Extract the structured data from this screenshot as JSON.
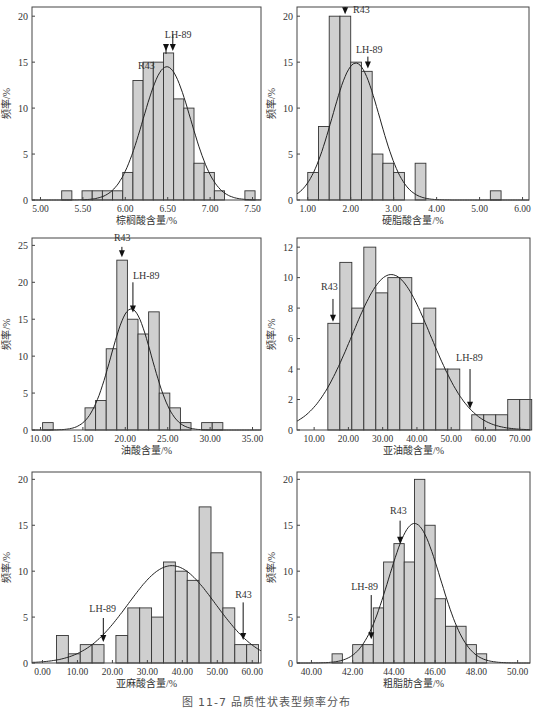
{
  "figure": {
    "caption": "图 11-7  品质性状表型频率分布"
  },
  "chart_data": [
    {
      "id": "palmitic",
      "type": "bar",
      "title": "",
      "xlabel": "棕榈酸含量/%",
      "ylabel": "频率/%",
      "xlim": [
        4.9,
        7.6
      ],
      "ylim": [
        0,
        21
      ],
      "xticks": [
        5.0,
        5.5,
        6.0,
        6.5,
        7.0,
        7.5
      ],
      "xtick_labels": [
        "5.00",
        "5.50",
        "6.00",
        "6.50",
        "7.00",
        "7.50"
      ],
      "yticks": [
        0,
        5,
        10,
        15,
        20
      ],
      "bin_width": 0.12,
      "bins": [
        {
          "x": 5.25,
          "y": 1
        },
        {
          "x": 5.49,
          "y": 1
        },
        {
          "x": 5.61,
          "y": 1
        },
        {
          "x": 5.73,
          "y": 1
        },
        {
          "x": 5.85,
          "y": 1
        },
        {
          "x": 5.97,
          "y": 3
        },
        {
          "x": 6.09,
          "y": 13
        },
        {
          "x": 6.21,
          "y": 15
        },
        {
          "x": 6.33,
          "y": 15
        },
        {
          "x": 6.45,
          "y": 16
        },
        {
          "x": 6.57,
          "y": 11
        },
        {
          "x": 6.69,
          "y": 10
        },
        {
          "x": 6.81,
          "y": 4
        },
        {
          "x": 6.93,
          "y": 3
        },
        {
          "x": 7.05,
          "y": 1
        },
        {
          "x": 7.41,
          "y": 1
        }
      ],
      "normal_curve": {
        "mean": 6.49,
        "sd": 0.28,
        "peak": 14.5
      },
      "annotations": [
        {
          "label": "R43",
          "x": 6.48,
          "label_dx": -28,
          "label_y": 14.3,
          "arrow_from": 15.9,
          "arrow_to": 16.2
        },
        {
          "label": "LH-89",
          "x": 6.56,
          "label_dx": -8,
          "label_y": 17.6,
          "arrow_from": 18.0,
          "arrow_to": 16.2
        }
      ],
      "grid": false
    },
    {
      "id": "stearic",
      "type": "bar",
      "title": "",
      "xlabel": "硬脂酸含量/%",
      "ylabel": "频率/%",
      "xlim": [
        0.75,
        6.15
      ],
      "ylim": [
        0,
        21
      ],
      "xticks": [
        1,
        2,
        3,
        4,
        5,
        6
      ],
      "xtick_labels": [
        "1.00",
        "2.00",
        "3.00",
        "4.00",
        "5.00",
        "6.00"
      ],
      "yticks": [
        0,
        5,
        10,
        15,
        20
      ],
      "bin_width": 0.25,
      "bins": [
        {
          "x": 1.0,
          "y": 3
        },
        {
          "x": 1.25,
          "y": 8
        },
        {
          "x": 1.5,
          "y": 20
        },
        {
          "x": 1.75,
          "y": 20
        },
        {
          "x": 2.0,
          "y": 15
        },
        {
          "x": 2.25,
          "y": 14
        },
        {
          "x": 2.5,
          "y": 5
        },
        {
          "x": 2.75,
          "y": 4
        },
        {
          "x": 3.0,
          "y": 3
        },
        {
          "x": 3.5,
          "y": 4
        },
        {
          "x": 5.25,
          "y": 1
        }
      ],
      "normal_curve": {
        "mean": 2.12,
        "sd": 0.55,
        "peak": 14.9
      },
      "annotations": [
        {
          "label": "R43",
          "x": 1.87,
          "label_dx": 8,
          "label_y": 20.4,
          "arrow_from": 21.0,
          "arrow_to": 20.2
        },
        {
          "label": "LH-89",
          "x": 2.4,
          "label_dx": -12,
          "label_y": 16.0,
          "arrow_from": 15.6,
          "arrow_to": 14.3
        }
      ],
      "grid": false
    },
    {
      "id": "oleic",
      "type": "bar",
      "title": "",
      "xlabel": "油酸含量/%",
      "ylabel": "频率/%",
      "xlim": [
        9.0,
        36.0
      ],
      "ylim": [
        0,
        26
      ],
      "xticks": [
        10,
        15,
        20,
        25,
        30,
        35
      ],
      "xtick_labels": [
        "10.00",
        "15.00",
        "20.00",
        "25.00",
        "30.00",
        "35.00"
      ],
      "yticks": [
        0,
        5,
        10,
        15,
        20,
        25
      ],
      "bin_width": 1.25,
      "bins": [
        {
          "x": 10.25,
          "y": 1
        },
        {
          "x": 15.25,
          "y": 3
        },
        {
          "x": 16.5,
          "y": 4
        },
        {
          "x": 17.75,
          "y": 11
        },
        {
          "x": 19.0,
          "y": 23
        },
        {
          "x": 20.25,
          "y": 15
        },
        {
          "x": 21.5,
          "y": 13
        },
        {
          "x": 22.75,
          "y": 16
        },
        {
          "x": 24.0,
          "y": 5
        },
        {
          "x": 25.25,
          "y": 3
        },
        {
          "x": 26.5,
          "y": 1
        },
        {
          "x": 29.0,
          "y": 1
        },
        {
          "x": 30.25,
          "y": 1
        }
      ],
      "normal_curve": {
        "mean": 20.7,
        "sd": 2.4,
        "peak": 16.4
      },
      "annotations": [
        {
          "label": "R43",
          "x": 19.6,
          "label_dx": -8,
          "label_y": 25.6,
          "arrow_from": 24.8,
          "arrow_to": 23.4
        },
        {
          "label": "LH-89",
          "x": 20.9,
          "label_dx": 0,
          "label_y": 20.4,
          "arrow_from": 20.0,
          "arrow_to": 15.9
        }
      ],
      "grid": false
    },
    {
      "id": "linoleic",
      "type": "bar",
      "title": "",
      "xlabel": "亚油酸含量/%",
      "ylabel": "频率/%",
      "xlim": [
        5.0,
        73.0
      ],
      "ylim": [
        0,
        12.6
      ],
      "xticks": [
        10,
        20,
        30,
        40,
        50,
        60,
        70
      ],
      "xtick_labels": [
        "10.00",
        "20.00",
        "30.00",
        "40.00",
        "50.00",
        "60.00",
        "70.00"
      ],
      "yticks": [
        0,
        2,
        4,
        6,
        8,
        10,
        12
      ],
      "bin_width": 3.5,
      "bins": [
        {
          "x": 14.0,
          "y": 7
        },
        {
          "x": 17.5,
          "y": 11
        },
        {
          "x": 21.0,
          "y": 8
        },
        {
          "x": 24.5,
          "y": 12
        },
        {
          "x": 28.0,
          "y": 9
        },
        {
          "x": 31.5,
          "y": 10
        },
        {
          "x": 35.0,
          "y": 10
        },
        {
          "x": 38.5,
          "y": 7
        },
        {
          "x": 42.0,
          "y": 8
        },
        {
          "x": 45.5,
          "y": 4
        },
        {
          "x": 49.0,
          "y": 4
        },
        {
          "x": 56.0,
          "y": 1
        },
        {
          "x": 59.5,
          "y": 1
        },
        {
          "x": 63.0,
          "y": 1
        },
        {
          "x": 66.5,
          "y": 2
        },
        {
          "x": 70.0,
          "y": 2
        }
      ],
      "normal_curve": {
        "mean": 32.5,
        "sd": 11.5,
        "peak": 10.2
      },
      "annotations": [
        {
          "label": "R43",
          "x": 15.5,
          "label_dx": -12,
          "label_y": 9.2,
          "arrow_from": 8.6,
          "arrow_to": 7.1
        },
        {
          "label": "LH-89",
          "x": 55.5,
          "label_dx": -14,
          "label_y": 4.5,
          "arrow_from": 4.0,
          "arrow_to": 1.4
        }
      ],
      "grid": false
    },
    {
      "id": "linolenic",
      "type": "bar",
      "title": "",
      "xlabel": "亚麻酸含量/%",
      "ylabel": "频率/%",
      "xlim": [
        -3.0,
        62.5
      ],
      "ylim": [
        0,
        20.8
      ],
      "xticks": [
        0,
        10,
        20,
        30,
        40,
        50,
        60
      ],
      "xtick_labels": [
        "0.00",
        "10.00",
        "20.00",
        "30.00",
        "40.00",
        "50.00",
        "60.00"
      ],
      "yticks": [
        0,
        5,
        10,
        15,
        20
      ],
      "bin_width": 3.4,
      "bins": [
        {
          "x": 4.0,
          "y": 3
        },
        {
          "x": 7.4,
          "y": 1
        },
        {
          "x": 10.8,
          "y": 2
        },
        {
          "x": 14.2,
          "y": 2
        },
        {
          "x": 21.0,
          "y": 3
        },
        {
          "x": 24.4,
          "y": 6
        },
        {
          "x": 27.8,
          "y": 6
        },
        {
          "x": 31.2,
          "y": 5
        },
        {
          "x": 34.6,
          "y": 11
        },
        {
          "x": 38.0,
          "y": 10
        },
        {
          "x": 41.4,
          "y": 9
        },
        {
          "x": 44.8,
          "y": 17
        },
        {
          "x": 48.2,
          "y": 12
        },
        {
          "x": 51.6,
          "y": 6
        },
        {
          "x": 55.0,
          "y": 2
        },
        {
          "x": 58.4,
          "y": 2
        }
      ],
      "normal_curve": {
        "mean": 37.0,
        "sd": 12.5,
        "peak": 10.6
      },
      "annotations": [
        {
          "label": "LH-89",
          "x": 17.4,
          "label_dx": -14,
          "label_y": 5.5,
          "arrow_from": 4.9,
          "arrow_to": 2.3
        },
        {
          "label": "R43",
          "x": 57.4,
          "label_dx": -8,
          "label_y": 7.1,
          "arrow_from": 6.6,
          "arrow_to": 2.5
        }
      ],
      "grid": false
    },
    {
      "id": "crude-fat",
      "type": "bar",
      "title": "",
      "xlabel": "粗脂肪含量/%",
      "ylabel": "频率/%",
      "xlim": [
        39.3,
        50.6
      ],
      "ylim": [
        0,
        20.8
      ],
      "xticks": [
        40,
        42,
        44,
        46,
        48,
        50
      ],
      "xtick_labels": [
        "40.00",
        "42.00",
        "44.00",
        "46.00",
        "48.00",
        "50.00"
      ],
      "yticks": [
        0,
        5,
        10,
        15,
        20
      ],
      "bin_width": 0.5,
      "bins": [
        {
          "x": 41.0,
          "y": 1
        },
        {
          "x": 42.0,
          "y": 2
        },
        {
          "x": 42.5,
          "y": 2
        },
        {
          "x": 43.0,
          "y": 6
        },
        {
          "x": 43.5,
          "y": 11
        },
        {
          "x": 44.0,
          "y": 13
        },
        {
          "x": 44.5,
          "y": 11
        },
        {
          "x": 45.0,
          "y": 20
        },
        {
          "x": 45.5,
          "y": 15
        },
        {
          "x": 46.0,
          "y": 7
        },
        {
          "x": 46.5,
          "y": 4
        },
        {
          "x": 47.0,
          "y": 4
        },
        {
          "x": 47.5,
          "y": 2
        },
        {
          "x": 48.0,
          "y": 1
        }
      ],
      "normal_curve": {
        "mean": 45.0,
        "sd": 1.25,
        "peak": 15.2
      },
      "annotations": [
        {
          "label": "R43",
          "x": 44.3,
          "label_dx": -10,
          "label_y": 16.2,
          "arrow_from": 15.5,
          "arrow_to": 13.0
        },
        {
          "label": "LH-89",
          "x": 42.9,
          "label_dx": -20,
          "label_y": 8.0,
          "arrow_from": 7.4,
          "arrow_to": 2.6
        }
      ],
      "grid": false
    }
  ],
  "layout": {
    "panels": [
      {
        "left": 32,
        "top": 7,
        "right": 261,
        "bottom": 200
      },
      {
        "left": 297,
        "top": 7,
        "right": 529,
        "bottom": 200
      },
      {
        "left": 32,
        "top": 238,
        "right": 261,
        "bottom": 430
      },
      {
        "left": 297,
        "top": 238,
        "right": 530,
        "bottom": 430
      },
      {
        "left": 32,
        "top": 472,
        "right": 261,
        "bottom": 663
      },
      {
        "left": 297,
        "top": 472,
        "right": 530,
        "bottom": 663
      }
    ],
    "colors": {
      "bar_fill": "#cfcfcf",
      "bar_stroke": "#333333",
      "curve": "#222222",
      "axis": "#444444"
    }
  }
}
